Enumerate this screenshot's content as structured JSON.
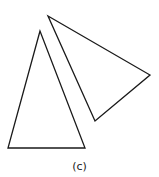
{
  "figure": {
    "caption": "(c)",
    "stroke_color": "#1a1a1a",
    "shapes": [
      {
        "name": "triangle-left",
        "points": "40,31 8,148 85,148"
      },
      {
        "name": "triangle-right",
        "points": "48,16 150,75 95,121"
      }
    ]
  }
}
